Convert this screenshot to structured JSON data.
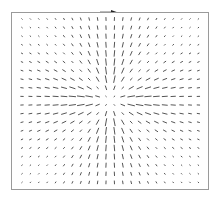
{
  "chart_data": {
    "type": "quiver",
    "title": "",
    "xlabel": "",
    "ylabel": "",
    "grid": false,
    "legend": null,
    "grid_columns": 22,
    "grid_rows": 20,
    "x_range": [
      -1,
      1
    ],
    "y_range": [
      -1,
      1
    ],
    "field_description": "Radial vector field centered at origin; segments point along radial direction, longest along the horizontal and vertical axes near the center, short along diagonals and near edges, zero at the exact center",
    "center_px": [
      110,
      100
    ],
    "column_x_px_start": 22,
    "column_spacing_px": 8.4,
    "row_y_px_start": 19,
    "row_spacing_px": 8.6,
    "max_segment_px": 8,
    "arrow_color": "#555555"
  },
  "frame": {
    "border_color": "#9a9a9a"
  },
  "top_mark": {
    "color": "#333333"
  }
}
